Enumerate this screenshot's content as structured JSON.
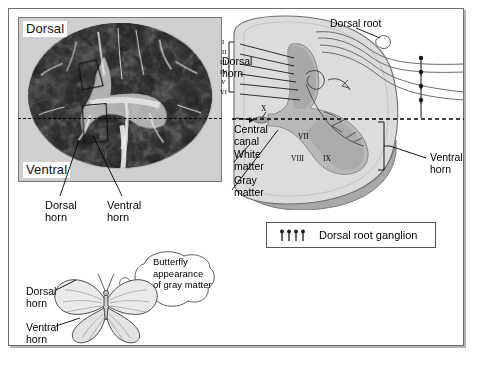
{
  "photo_panel": {
    "label_dorsal": "Dorsal",
    "label_ventral": "Ventral",
    "callouts": {
      "dorsal_horn": "Dorsal\nhorn",
      "dorsal_horn_line1": "Dorsal",
      "dorsal_horn_line2": "horn",
      "ventral_horn_line1": "Ventral",
      "ventral_horn_line2": "horn"
    }
  },
  "diagram": {
    "labels": {
      "dorsal_root": "Dorsal root",
      "dorsal_horn_line1": "Dorsal",
      "dorsal_horn_line2": "horn",
      "central_canal_line1": "Central",
      "central_canal_line2": "canal",
      "white_matter_line1": "White",
      "white_matter_line2": "matter",
      "gray_matter_line1": "Gray",
      "gray_matter_line2": "matter",
      "ventral_horn_line1": "Ventral",
      "ventral_horn_line2": "horn"
    },
    "laminae_dorsal": [
      "I",
      "II",
      "III",
      "IV",
      "V",
      "VI"
    ],
    "laminae_ventral": [
      "VII",
      "VIII",
      "IX"
    ],
    "lamina_central": "X",
    "nerve_root_count": 4
  },
  "legend": {
    "symbol": "dorsal-root-ganglion-marker",
    "symbol_count": 4,
    "text": "Dorsal root ganglion"
  },
  "butterfly_panel": {
    "bubble_line1": "Butterfly",
    "bubble_line2": "appearance",
    "bubble_line3": "of gray matter",
    "dorsal_horn_line1": "Dorsal",
    "dorsal_horn_line2": "horn",
    "ventral_horn_line1": "Ventral",
    "ventral_horn_line2": "horn"
  },
  "colors": {
    "frame_border": "#6e6e6e",
    "white_matter_fill": "#dcdcdc",
    "gray_matter_fill": "#b4b4b4",
    "gray_matter_dark": "#9a9a9a",
    "cord_edge": "#707070",
    "cord_side_shadow": "#8a8a8a",
    "line_black": "#000000",
    "page_background": "#ffffff"
  }
}
